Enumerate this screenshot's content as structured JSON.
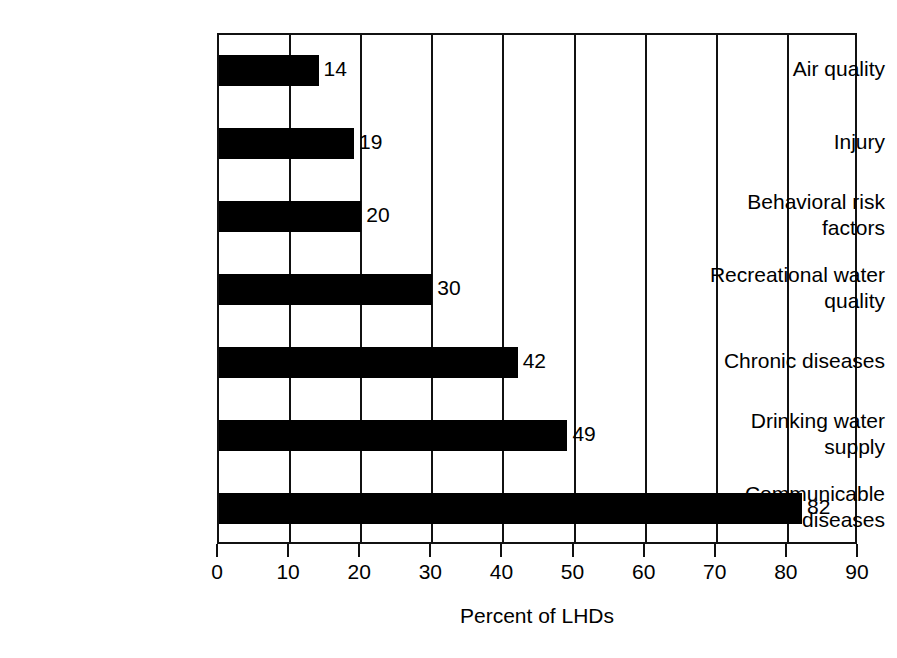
{
  "chart_data": {
    "type": "bar",
    "orientation": "horizontal",
    "title": "",
    "subtitle": "",
    "xlabel": "Percent of LHDs",
    "ylabel": "",
    "xlim": [
      0,
      90
    ],
    "xticks": [
      0,
      10,
      20,
      30,
      40,
      50,
      60,
      70,
      80,
      90
    ],
    "xtick_labels": [
      "0",
      "10",
      "20",
      "30",
      "40",
      "50",
      "60",
      "70",
      "80",
      "90"
    ],
    "grid": "vertical",
    "legend": "none",
    "bar_color": "#000000",
    "axis_color": "#111111",
    "background_color": "#ffffff",
    "categories": [
      "Air quality",
      "Injury",
      "Behavioral risk factors",
      "Recreational water quality",
      "Chronic diseases",
      "Drinking water supply",
      "Communicable diseases"
    ],
    "category_lines": [
      [
        "Air quality"
      ],
      [
        "Injury"
      ],
      [
        "Behavioral risk",
        "factors"
      ],
      [
        "Recreational water",
        "quality"
      ],
      [
        "Chronic diseases"
      ],
      [
        "Drinking water",
        "supply"
      ],
      [
        "Communicable",
        "diseases"
      ]
    ],
    "values": [
      14,
      19,
      20,
      30,
      42,
      49,
      82
    ],
    "value_labels": [
      "14",
      "19",
      "20",
      "30",
      "42",
      "49",
      "82"
    ]
  }
}
